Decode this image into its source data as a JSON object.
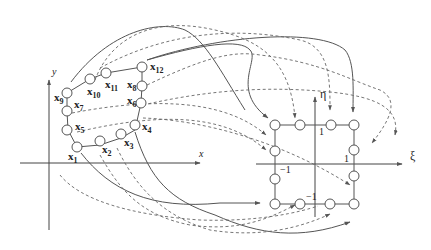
{
  "figure": {
    "physical_axes": {
      "x_label": "x",
      "y_label": "y"
    },
    "reference_axes": {
      "xi_label": "ξ",
      "eta_label": "η"
    },
    "reference_ticks": {
      "top": "1",
      "right": "1",
      "left": "−1",
      "bottom": "−1"
    },
    "node_labels": [
      {
        "base": "x",
        "sub": "1"
      },
      {
        "base": "x",
        "sub": "2"
      },
      {
        "base": "x",
        "sub": "3"
      },
      {
        "base": "x",
        "sub": "4"
      },
      {
        "base": "x",
        "sub": "5"
      },
      {
        "base": "x",
        "sub": "6"
      },
      {
        "base": "x",
        "sub": "7"
      },
      {
        "base": "x",
        "sub": "8"
      },
      {
        "base": "x",
        "sub": "9"
      },
      {
        "base": "x",
        "sub": "10"
      },
      {
        "base": "x",
        "sub": "11"
      },
      {
        "base": "x",
        "sub": "12"
      }
    ]
  }
}
